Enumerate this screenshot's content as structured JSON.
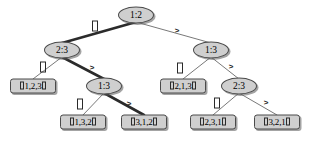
{
  "diagram": {
    "type": "decision-tree",
    "colors": {
      "node_fill": "#cfcfcf",
      "node_stroke": "#4a4a4a",
      "edge": "#555555",
      "highlight_edge": "#2b2b2b",
      "background": "#ffffff",
      "text": "#000000"
    },
    "edge_labels": {
      "le": "□",
      "le_meaning": "less-or-equal (rendered as missing-glyph box)",
      "gt": ">"
    },
    "nodes": [
      {
        "id": "n0",
        "label": "1:2",
        "kind": "internal",
        "x": 136,
        "y": 15
      },
      {
        "id": "n1",
        "label": "2:3",
        "kind": "internal",
        "x": 62,
        "y": 50
      },
      {
        "id": "n2",
        "label": "1:3",
        "kind": "internal",
        "x": 211,
        "y": 50
      },
      {
        "id": "n3",
        "label": "1,2,3",
        "kind": "leaf",
        "x": 33,
        "y": 86
      },
      {
        "id": "n4",
        "label": "1:3",
        "kind": "internal",
        "x": 104,
        "y": 86
      },
      {
        "id": "n5",
        "label": "2,1,3",
        "kind": "leaf",
        "x": 183,
        "y": 86
      },
      {
        "id": "n6",
        "label": "2:3",
        "kind": "internal",
        "x": 239,
        "y": 86
      },
      {
        "id": "n7",
        "label": "1,3,2",
        "kind": "leaf",
        "x": 83,
        "y": 122
      },
      {
        "id": "n8",
        "label": "3,1,2",
        "kind": "leaf",
        "x": 144,
        "y": 122
      },
      {
        "id": "n9",
        "label": "2,3,1",
        "kind": "leaf",
        "x": 213,
        "y": 122
      },
      {
        "id": "n10",
        "label": "3,2,1",
        "kind": "leaf",
        "x": 277,
        "y": 122
      }
    ],
    "edges": [
      {
        "from": "n0",
        "to": "n1",
        "label": "le",
        "highlight": true,
        "lx": 95,
        "ly": 27
      },
      {
        "from": "n0",
        "to": "n2",
        "label": "gt",
        "highlight": false,
        "lx": 177,
        "ly": 31
      },
      {
        "from": "n1",
        "to": "n3",
        "label": "le",
        "highlight": false,
        "lx": 43,
        "ly": 68
      },
      {
        "from": "n1",
        "to": "n4",
        "label": "gt",
        "highlight": true,
        "lx": 92,
        "ly": 68
      },
      {
        "from": "n2",
        "to": "n5",
        "label": "le",
        "highlight": false,
        "lx": 180,
        "ly": 69
      },
      {
        "from": "n2",
        "to": "n6",
        "label": "gt",
        "highlight": false,
        "lx": 231,
        "ly": 67
      },
      {
        "from": "n4",
        "to": "n7",
        "label": "le",
        "highlight": false,
        "lx": 80,
        "ly": 105
      },
      {
        "from": "n4",
        "to": "n8",
        "label": "gt",
        "highlight": true,
        "lx": 129,
        "ly": 104
      },
      {
        "from": "n6",
        "to": "n9",
        "label": "le",
        "highlight": false,
        "lx": 217,
        "ly": 104
      },
      {
        "from": "n6",
        "to": "n10",
        "label": "gt",
        "highlight": false,
        "lx": 266,
        "ly": 103
      }
    ],
    "highlight_path": [
      "n0",
      "n1",
      "n4",
      "n8"
    ]
  }
}
